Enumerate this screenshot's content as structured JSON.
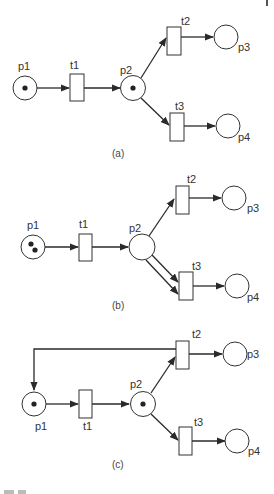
{
  "figure": {
    "colors": {
      "stroke": "#333333",
      "token": "#222222",
      "background": "#ffffff"
    },
    "panels": [
      {
        "caption": "(a)",
        "labels": {
          "p1": "p1",
          "t1": "t1",
          "p2": "p2",
          "t2": "t2",
          "p3": "p3",
          "t3": "t3",
          "p4": "p4"
        },
        "tokens": {
          "p1": 1,
          "p2": 1,
          "p3": 0,
          "p4": 0
        },
        "arcs": [
          "p1→t1",
          "t1→p2",
          "p2→t2",
          "t2→p3",
          "p2→t3",
          "t3→p4"
        ]
      },
      {
        "caption": "(b)",
        "labels": {
          "p1": "p1",
          "t1": "t1",
          "p2": "p2",
          "t2": "t2",
          "p3": "p3",
          "t3": "t3",
          "p4": "p4"
        },
        "tokens": {
          "p1": 2,
          "p2": 0,
          "p3": 0,
          "p4": 0
        },
        "arcs": [
          "p1→t1",
          "t1→p2",
          "p2→t2",
          "t2→p3",
          "p2→t3 (weight 2)",
          "t3→p4"
        ]
      },
      {
        "caption": "(c)",
        "labels": {
          "p1": "p1",
          "t1": "t1",
          "p2": "p2",
          "t2": "t2",
          "p3": "p3",
          "t3": "t3",
          "p4": "p4"
        },
        "tokens": {
          "p1": 1,
          "p2": 1,
          "p3": 0,
          "p4": 0
        },
        "arcs": [
          "p1→t1",
          "t1→p2",
          "p2→t2",
          "t2→p3",
          "t2→p1",
          "p2→t3",
          "t3→p4"
        ]
      }
    ]
  }
}
